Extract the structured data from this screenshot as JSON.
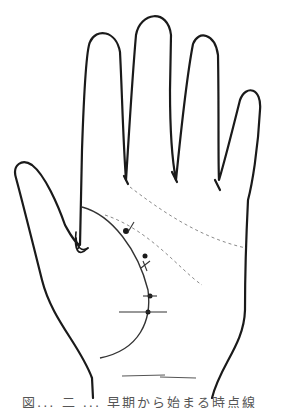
{
  "figure": {
    "colors": {
      "outline": "#1a1a1a",
      "dashed_lines": "#8a8a8a",
      "background": "#ffffff"
    },
    "life_line_markers": [
      {
        "type": "dot-with-tick",
        "label": "marker-1"
      },
      {
        "type": "dot",
        "label": "marker-2"
      },
      {
        "type": "cross",
        "label": "marker-3"
      },
      {
        "type": "dot-with-tick",
        "label": "marker-4"
      },
      {
        "type": "dot-with-long-horizontal",
        "label": "marker-5"
      }
    ],
    "dashed_lines": [
      "heart-line-guide",
      "head-line-guide"
    ]
  },
  "caption": {
    "text": "図... 二 ... 早期から始まる時点線"
  }
}
